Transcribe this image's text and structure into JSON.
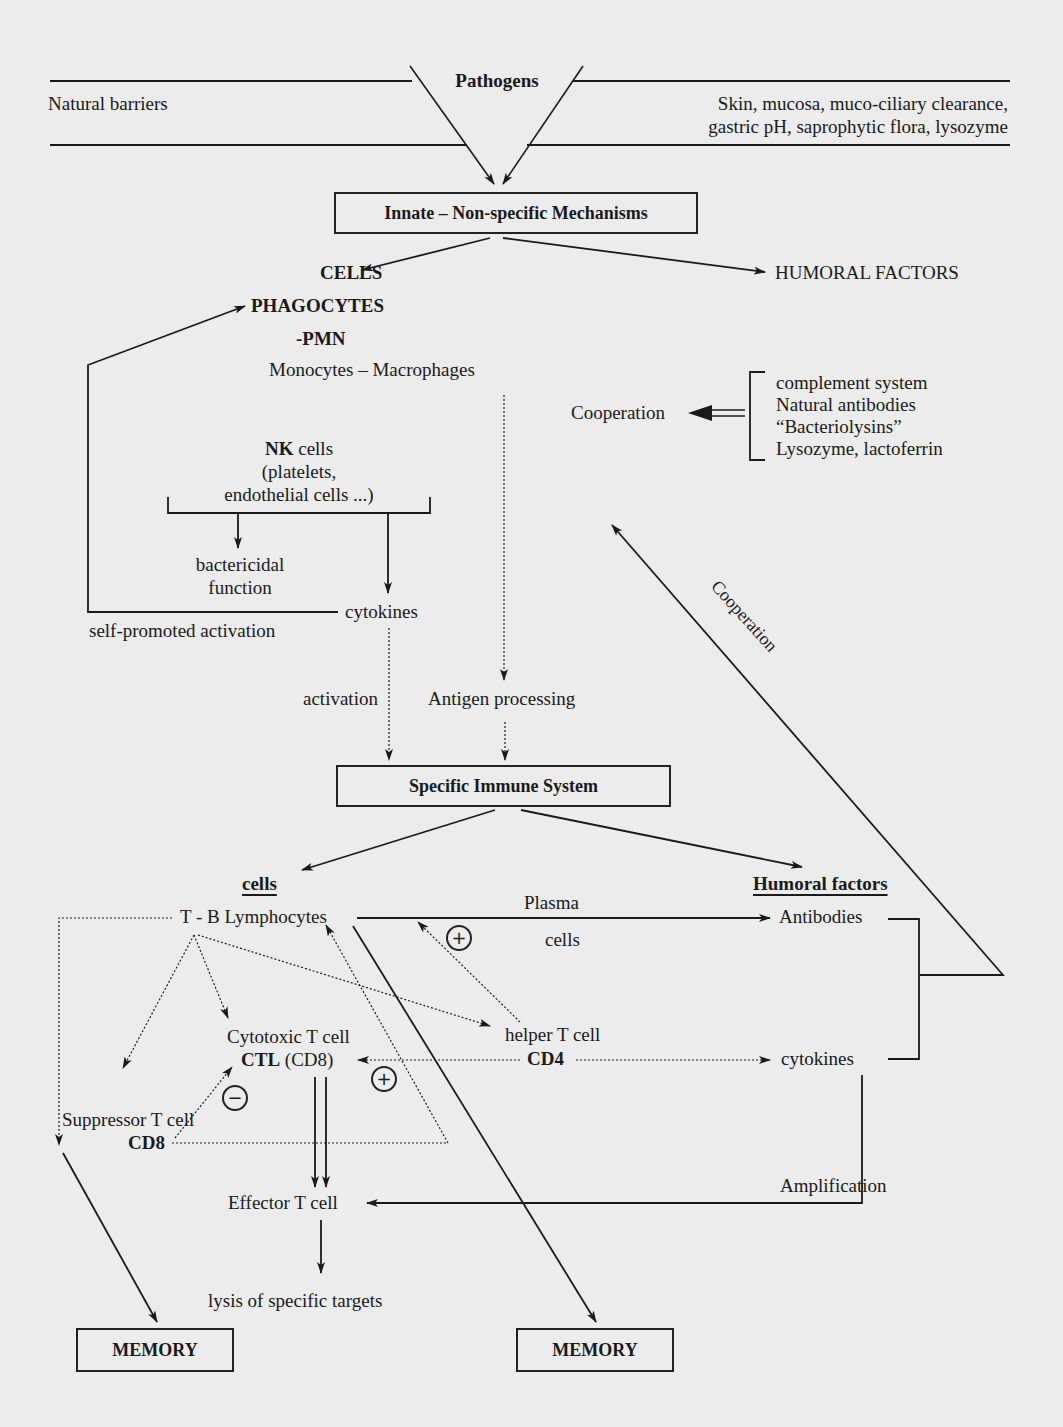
{
  "barrier": {
    "left_label": "Natural barriers",
    "pathogens": "Pathogens",
    "right_line1": "Skin, mucosa, muco-ciliary clearance,",
    "right_line2": "gastric pH, saprophytic flora, lysozyme"
  },
  "innate": {
    "title": "Innate – Non-specific Mechanisms",
    "cells": "CELLS",
    "humoral": "HUMORAL FACTORS",
    "phagocytes": "PHAGOCYTES",
    "pmn": "-PMN",
    "monocytes": "Monocytes – Macrophages",
    "nk_bold": "NK",
    "nk_rest": " cells",
    "nk_line2": "(platelets,",
    "nk_line3": "endothelial cells ...)",
    "bactericidal1": "bactericidal",
    "bactericidal2": "function",
    "cytokines": "cytokines",
    "self_promoted": "self-promoted activation",
    "cooperation": "Cooperation",
    "humoral_list": [
      "complement system",
      "Natural antibodies",
      "“Bacteriolysins”",
      "Lysozyme, lactoferrin"
    ]
  },
  "transition": {
    "activation": "activation",
    "antigen_processing": "Antigen processing",
    "cooperation_diag": "Cooperation"
  },
  "specific": {
    "title": "Specific Immune System",
    "cells_heading": "cells",
    "humoral_heading": "Humoral factors",
    "tb_lymphocytes": "T - B Lymphocytes",
    "plasma": "Plasma",
    "plasma_cells": "cells",
    "antibodies": "Antibodies",
    "helper1": "helper T cell",
    "helper2": "CD4",
    "cytotoxic1": "Cytotoxic T cell",
    "ctl_bold": "CTL",
    "ctl_rest": " (CD8)",
    "cytokines": "cytokines",
    "suppressor1": "Suppressor T  cell",
    "suppressor2": "CD8",
    "effector": "Effector T cell",
    "amplification": "Amplification",
    "lysis": "lysis of specific targets",
    "plus": "+",
    "minus": "−",
    "memory_left": "MEMORY",
    "memory_right": "MEMORY"
  }
}
